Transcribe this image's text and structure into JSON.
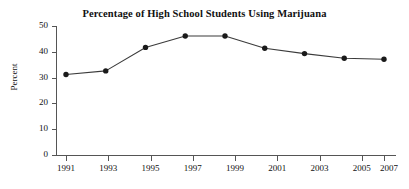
{
  "chart_data": {
    "type": "line",
    "title": "Percentage of High School Students Using Marijuana",
    "xlabel": "",
    "ylabel": "Percent",
    "categories": [
      "1991",
      "1993",
      "1995",
      "1997",
      "1999",
      "2001",
      "2003",
      "2005",
      "2007"
    ],
    "values": [
      31.2,
      32.6,
      41.7,
      46.1,
      46.1,
      41.4,
      39.3,
      37.5,
      37.1
    ],
    "x": [
      1991,
      1993,
      1995,
      1997,
      1999,
      2001,
      2003,
      2005,
      2007
    ],
    "series": [
      {
        "name": "Percent of high school students using marijuana",
        "values": [
          31.2,
          32.6,
          41.7,
          46.1,
          46.1,
          41.4,
          39.3,
          37.5,
          37.1
        ]
      }
    ],
    "xlim": [
      1991,
      2007
    ],
    "ylim": [
      0,
      50
    ],
    "ytick_labels": [
      "0",
      "10",
      "20",
      "30",
      "40",
      "50"
    ],
    "ytick_values": [
      0,
      10,
      20,
      30,
      40,
      50
    ],
    "xtick_labels": [
      "1991",
      "1993",
      "1995",
      "1997",
      "1999",
      "2001",
      "2003",
      "2005",
      "2007"
    ],
    "grid": false,
    "legend": "none",
    "marker": "filled-circle",
    "line_color": "#3b3b3b",
    "marker_color": "#1a1a1a",
    "axis_color": "#555555",
    "background_color": "#ffffff",
    "text_color": "#111111"
  }
}
